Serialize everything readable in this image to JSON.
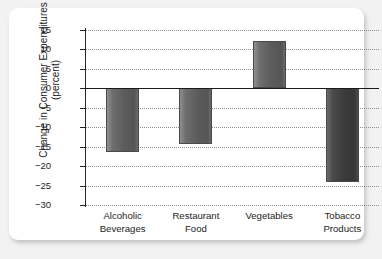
{
  "chart_data": {
    "type": "bar",
    "title": "",
    "subtitle": "",
    "xlabel": "",
    "ylabel": "Change in Consumer Expenditures (percent)",
    "ylabel_line1": "Change in Consumer Expenditures",
    "ylabel_line2": "(percent)",
    "categories": [
      "Alcoholic Beverages",
      "Restaurant Food",
      "Vegetables",
      "Tobacco Products"
    ],
    "category_lines": [
      [
        "Alcoholic",
        "Beverages"
      ],
      [
        "Restaurant",
        "Food"
      ],
      [
        "Vegetables",
        ""
      ],
      [
        "Tobacco",
        "Products"
      ]
    ],
    "values": [
      -16.5,
      -14.2,
      12.3,
      -24.2
    ],
    "ylim": [
      -30,
      15
    ],
    "ytick_values": [
      15,
      10,
      5,
      0,
      -5,
      -10,
      -15,
      -20,
      -25,
      -30
    ],
    "ytick_labels": [
      "15",
      "10",
      "5",
      "0",
      "−5",
      "−10",
      "−15",
      "−20",
      "−25",
      "−30"
    ],
    "grid": true,
    "grid_style": "dotted",
    "legend": "none",
    "zero_line": 0,
    "bar_colors": [
      "#5c5c5c",
      "#4f4f4f",
      "#5c5c5c",
      "#3b3b3b"
    ],
    "background_color": "#ffffff",
    "page_background_color": "#f2f2f2",
    "axis_color": "#262626",
    "grid_color": "#8d8d8d"
  }
}
